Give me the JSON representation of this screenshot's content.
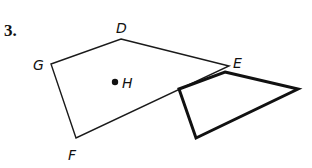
{
  "problem": {
    "number": "3."
  },
  "figure": {
    "polygon_main": {
      "name": "DEFG",
      "vertices": [
        {
          "label": "D",
          "x": 121,
          "y": 39,
          "lx": 116,
          "ly": 33
        },
        {
          "label": "E",
          "x": 229,
          "y": 66,
          "lx": 233,
          "ly": 68
        },
        {
          "label": "F",
          "x": 76,
          "y": 138,
          "lx": 68,
          "ly": 160
        },
        {
          "label": "G",
          "x": 51,
          "y": 64,
          "lx": 33,
          "ly": 70
        }
      ],
      "stroke_width": 1.4,
      "color": "#1a1a1a"
    },
    "point": {
      "label": "H",
      "x": 115,
      "y": 82,
      "lx": 122,
      "ly": 88
    },
    "polygon_image": {
      "vertices": [
        {
          "x": 225,
          "y": 72
        },
        {
          "x": 298,
          "y": 89
        },
        {
          "x": 196,
          "y": 138
        },
        {
          "x": 179,
          "y": 89
        }
      ],
      "stroke_width": 3,
      "color": "#111111"
    }
  }
}
